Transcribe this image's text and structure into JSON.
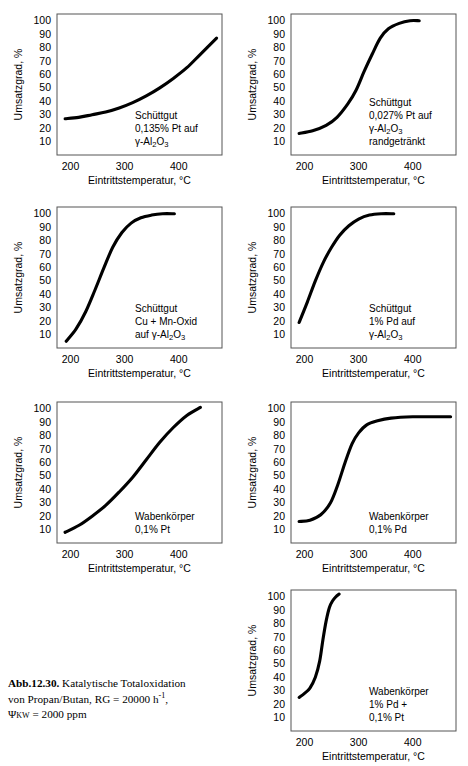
{
  "figure": {
    "caption_label": "Abb.12.30.",
    "caption_line1": " Katalytische Totaloxidation",
    "caption_line2": "von Propan/Butan, RG = 20000 h",
    "caption_line2_sup": "-1",
    "caption_line2_end": ",",
    "caption_line3_psi": "Ψ",
    "caption_line3_sub": "KW",
    "caption_line3_rest": " = 2000 ppm"
  },
  "axes": {
    "ylabel": "Umsatzgrad, %",
    "xlabel": "Eintrittstemperatur, °C",
    "yticks": [
      "100",
      "90",
      "80",
      "70",
      "60",
      "50",
      "40",
      "30",
      "20",
      "10"
    ],
    "xticks": [
      "200",
      "300",
      "400"
    ],
    "xlim": [
      175,
      480
    ],
    "ylim": [
      0,
      105
    ]
  },
  "chart_data": [
    {
      "type": "line",
      "id": "bulk-pt-0135",
      "title": "",
      "xlabel": "Eintrittstemperatur, °C",
      "ylabel": "Umsatzgrad, %",
      "xlim": [
        175,
        480
      ],
      "ylim": [
        0,
        105
      ],
      "grid": false,
      "annotation": [
        "Schüttgut",
        "0,135% Pt auf",
        "γ-Al2O3"
      ],
      "x": [
        190,
        215,
        240,
        265,
        290,
        315,
        340,
        365,
        390,
        415,
        440,
        470
      ],
      "values": [
        27,
        28,
        30,
        32,
        35,
        39,
        44,
        50,
        57,
        65,
        75,
        87
      ]
    },
    {
      "type": "line",
      "id": "bulk-pt-0027-rand",
      "title": "",
      "xlabel": "Eintrittstemperatur, °C",
      "ylabel": "Umsatzgrad, %",
      "xlim": [
        175,
        480
      ],
      "ylim": [
        0,
        105
      ],
      "grid": false,
      "annotation": [
        "Schüttgut",
        "0,027% Pt auf",
        "γ-Al2O3",
        "randgetränkt"
      ],
      "x": [
        190,
        215,
        240,
        260,
        280,
        295,
        310,
        325,
        340,
        355,
        375,
        395,
        412
      ],
      "values": [
        16,
        18,
        22,
        28,
        38,
        48,
        62,
        75,
        87,
        94,
        98,
        100,
        100
      ]
    },
    {
      "type": "line",
      "id": "bulk-cu-mn-oxid",
      "title": "",
      "xlabel": "Eintrittstemperatur, °C",
      "ylabel": "Umsatzgrad, %",
      "xlim": [
        175,
        480
      ],
      "ylim": [
        0,
        105
      ],
      "grid": false,
      "annotation": [
        "Schüttgut",
        "Cu + Mn-Oxid",
        "auf γ-Al2O3"
      ],
      "x": [
        192,
        210,
        228,
        245,
        262,
        278,
        295,
        312,
        330,
        350,
        370,
        392
      ],
      "values": [
        5,
        14,
        27,
        43,
        60,
        75,
        86,
        93,
        97,
        99,
        100,
        100
      ]
    },
    {
      "type": "line",
      "id": "bulk-pd-1",
      "title": "",
      "xlabel": "Eintrittstemperatur, °C",
      "ylabel": "Umsatzgrad, %",
      "xlim": [
        175,
        480
      ],
      "ylim": [
        0,
        105
      ],
      "grid": false,
      "annotation": [
        "Schüttgut",
        "1% Pd auf",
        "γ-Al2O3"
      ],
      "x": [
        190,
        205,
        220,
        235,
        250,
        265,
        282,
        300,
        320,
        342,
        365
      ],
      "values": [
        19,
        34,
        50,
        64,
        75,
        84,
        91,
        96,
        99,
        100,
        100
      ]
    },
    {
      "type": "line",
      "id": "honeycomb-pt-01",
      "title": "",
      "xlabel": "Eintrittstemperatur, °C",
      "ylabel": "Umsatzgrad, %",
      "xlim": [
        175,
        480
      ],
      "ylim": [
        0,
        105
      ],
      "grid": false,
      "annotation": [
        "Wabenkörper",
        "0,1% Pt"
      ],
      "x": [
        190,
        215,
        240,
        265,
        290,
        315,
        340,
        365,
        390,
        415,
        440
      ],
      "values": [
        8,
        13,
        20,
        28,
        38,
        49,
        62,
        75,
        86,
        95,
        101
      ]
    },
    {
      "type": "line",
      "id": "honeycomb-pd-01",
      "title": "",
      "xlabel": "Eintrittstemperatur, °C",
      "ylabel": "Umsatzgrad, %",
      "xlim": [
        175,
        480
      ],
      "ylim": [
        0,
        105
      ],
      "grid": false,
      "annotation": [
        "Wabenkörper",
        "0,1% Pd"
      ],
      "x": [
        190,
        210,
        230,
        248,
        262,
        275,
        288,
        300,
        315,
        335,
        360,
        400,
        440,
        470
      ],
      "values": [
        16,
        17,
        21,
        30,
        44,
        60,
        74,
        82,
        88,
        91,
        93,
        94,
        94,
        94
      ]
    },
    {
      "type": "line",
      "id": "honeycomb-pd1-pt01",
      "title": "",
      "xlabel": "Eintrittstemperatur, °C",
      "ylabel": "Umsatzgrad, %",
      "xlim": [
        175,
        480
      ],
      "ylim": [
        0,
        105
      ],
      "grid": false,
      "annotation": [
        "Wabenkörper",
        "1% Pd +",
        "0,1% Pt"
      ],
      "x": [
        190,
        200,
        210,
        220,
        228,
        234,
        240,
        246,
        252,
        258,
        264
      ],
      "values": [
        25,
        28,
        32,
        40,
        52,
        68,
        82,
        92,
        97,
        100,
        102
      ]
    }
  ]
}
